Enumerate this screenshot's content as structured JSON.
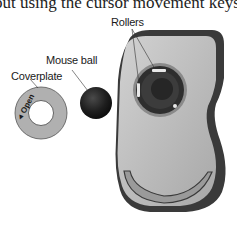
{
  "document": {
    "body_text_fragment": "out using the cursor movement keys. You"
  },
  "figure": {
    "labels": {
      "rollers": "Rollers",
      "mouse_ball": "Mouse ball",
      "coverplate": "Coverplate",
      "open_marking": "Open"
    },
    "colors": {
      "mouse_body": "#bdbdbd",
      "mouse_rim": "#3a3a3a",
      "ball": "#1e1e1e",
      "coverplate": "#b0b0b0",
      "socket": "#2e2e2e"
    }
  }
}
